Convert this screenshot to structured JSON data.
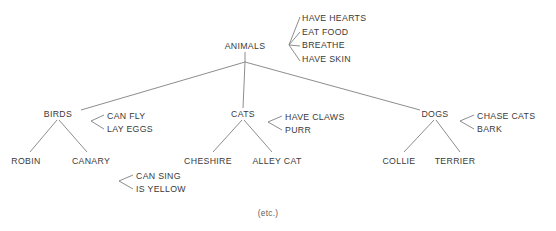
{
  "diagram": {
    "footer_note": "(etc.)",
    "line_color": "#808080",
    "text_color": "#3a3a3a",
    "background_color": "#ffffff"
  },
  "nodes": {
    "root": {
      "label": "ANIMALS",
      "x": 245,
      "y": 46
    },
    "birds": {
      "label": "BIRDS",
      "x": 58,
      "y": 114
    },
    "cats": {
      "label": "CATS",
      "x": 243,
      "y": 114
    },
    "dogs": {
      "label": "DOGS",
      "x": 435,
      "y": 114
    },
    "robin": {
      "label": "ROBIN",
      "x": 26,
      "y": 161
    },
    "canary": {
      "label": "CANARY",
      "x": 91,
      "y": 161
    },
    "cheshire": {
      "label": "CHESHIRE",
      "x": 208,
      "y": 161
    },
    "alley_cat": {
      "label": "ALLEY CAT",
      "x": 277,
      "y": 161
    },
    "collie": {
      "label": "COLLIE",
      "x": 399,
      "y": 161
    },
    "terrier": {
      "label": "TERRIER",
      "x": 455,
      "y": 161
    }
  },
  "properties": {
    "animals": [
      "HAVE HEARTS",
      "EAT FOOD",
      "BREATHE",
      "HAVE SKIN"
    ],
    "birds": [
      "CAN FLY",
      "LAY EGGS"
    ],
    "canary": [
      "CAN SING",
      "IS YELLOW"
    ],
    "cats": [
      "HAVE CLAWS",
      "PURR"
    ],
    "dogs": [
      "CHASE CATS",
      "BARK"
    ]
  },
  "property_positions": {
    "animals": {
      "text_x": 302,
      "first_y": 19,
      "step": 13.4,
      "hub_x": 289,
      "hub_y": 45
    },
    "birds": {
      "text_x": 107,
      "first_y": 117,
      "step": 13.0,
      "hub_x": 91,
      "hub_y": 121
    },
    "canary": {
      "text_x": 136,
      "first_y": 177,
      "step": 13.0,
      "hub_x": 119,
      "hub_y": 181
    },
    "cats": {
      "text_x": 285,
      "first_y": 118,
      "step": 13.0,
      "hub_x": 268,
      "hub_y": 122
    },
    "dogs": {
      "text_x": 477,
      "first_y": 117,
      "step": 13.0,
      "hub_x": 460,
      "hub_y": 121
    }
  },
  "footer": {
    "label": "(etc.)",
    "x": 268,
    "y": 213
  }
}
